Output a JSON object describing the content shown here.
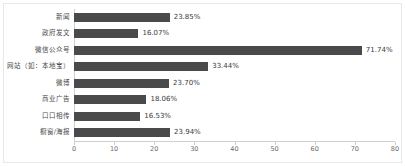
{
  "chart_data": {
    "type": "bar",
    "orientation": "horizontal",
    "title": "",
    "subtitle": "",
    "xlabel": "",
    "ylabel": "",
    "xlim": [
      0,
      80
    ],
    "grid": false,
    "legend": null,
    "bar_color": "#4a4a4a",
    "categories": [
      "新闻",
      "政府发文",
      "微信公众号",
      "网站（如：本地宝）",
      "微博",
      "商业广告",
      "口口相传",
      "橱窗/海报"
    ],
    "values": [
      23.85,
      16.07,
      71.74,
      33.44,
      23.7,
      18.06,
      16.53,
      23.94
    ],
    "value_labels": [
      "23.85%",
      "16.07%",
      "71.74%",
      "33.44%",
      "23.70%",
      "18.06%",
      "16.53%",
      "23.94%"
    ],
    "xticks": [
      0,
      10,
      20,
      30,
      40,
      50,
      60,
      70,
      80
    ],
    "xtick_labels": [
      "0",
      "10",
      "20",
      "30",
      "40",
      "50",
      "60",
      "70",
      "80"
    ]
  }
}
